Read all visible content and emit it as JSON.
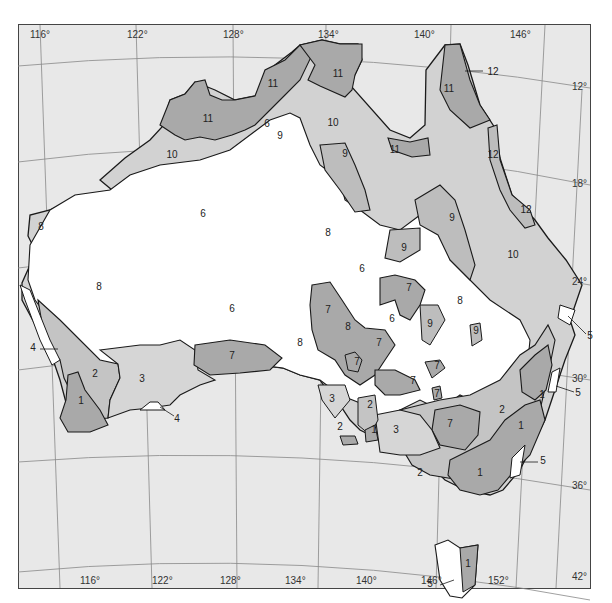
{
  "map": {
    "title": "",
    "colors": {
      "ocean": "#e8e8e8",
      "grid": "#888888",
      "outline": "#1a1a1a",
      "zone_light": "#d2d2d2",
      "zone_dark": "#a9a9a9",
      "zone_white": "#ffffff"
    },
    "longitude_labels_top": [
      "116°",
      "122°",
      "128°",
      "134°",
      "140°",
      "146°"
    ],
    "longitude_labels_bottom": [
      "116°",
      "122°",
      "128°",
      "134°",
      "140°",
      "146°",
      "152°"
    ],
    "latitude_labels": [
      "12°",
      "18°",
      "24°",
      "30°",
      "36°",
      "42°"
    ],
    "zone_labels": [
      {
        "id": "z11a",
        "text": "11",
        "x": 208,
        "y": 122
      },
      {
        "id": "z11b",
        "text": "11",
        "x": 273,
        "y": 87
      },
      {
        "id": "z11c",
        "text": "11",
        "x": 338,
        "y": 77
      },
      {
        "id": "z11d",
        "text": "11",
        "x": 449,
        "y": 92
      },
      {
        "id": "z11e",
        "text": "11",
        "x": 395,
        "y": 153
      },
      {
        "id": "z12a",
        "text": "12",
        "x": 493,
        "y": 75
      },
      {
        "id": "z12b",
        "text": "12",
        "x": 493,
        "y": 158
      },
      {
        "id": "z12c",
        "text": "12",
        "x": 526,
        "y": 213
      },
      {
        "id": "z6a",
        "text": "6",
        "x": 267,
        "y": 127
      },
      {
        "id": "z9a",
        "text": "9",
        "x": 280,
        "y": 139
      },
      {
        "id": "z10a",
        "text": "10",
        "x": 172,
        "y": 158
      },
      {
        "id": "z10b",
        "text": "10",
        "x": 333,
        "y": 126
      },
      {
        "id": "z9b",
        "text": "9",
        "x": 345,
        "y": 157
      },
      {
        "id": "z8a",
        "text": "8",
        "x": 41,
        "y": 230
      },
      {
        "id": "z6b",
        "text": "6",
        "x": 203,
        "y": 217
      },
      {
        "id": "z8b",
        "text": "8",
        "x": 328,
        "y": 236
      },
      {
        "id": "z9c",
        "text": "9",
        "x": 452,
        "y": 221
      },
      {
        "id": "z9d",
        "text": "9",
        "x": 404,
        "y": 251
      },
      {
        "id": "z10c",
        "text": "10",
        "x": 513,
        "y": 258
      },
      {
        "id": "z6c",
        "text": "6",
        "x": 362,
        "y": 272
      },
      {
        "id": "z8c",
        "text": "8",
        "x": 99,
        "y": 290
      },
      {
        "id": "z7a",
        "text": "7",
        "x": 409,
        "y": 291
      },
      {
        "id": "z8d",
        "text": "8",
        "x": 460,
        "y": 304
      },
      {
        "id": "z7b",
        "text": "7",
        "x": 328,
        "y": 313
      },
      {
        "id": "z8e",
        "text": "8",
        "x": 348,
        "y": 330
      },
      {
        "id": "z6d",
        "text": "6",
        "x": 392,
        "y": 322
      },
      {
        "id": "z9e",
        "text": "9",
        "x": 430,
        "y": 327
      },
      {
        "id": "z9f",
        "text": "9",
        "x": 476,
        "y": 334
      },
      {
        "id": "z6e",
        "text": "6",
        "x": 232,
        "y": 312
      },
      {
        "id": "z8f",
        "text": "8",
        "x": 300,
        "y": 346
      },
      {
        "id": "z7c",
        "text": "7",
        "x": 379,
        "y": 346
      },
      {
        "id": "z7d",
        "text": "7",
        "x": 357,
        "y": 365
      },
      {
        "id": "z7e",
        "text": "7",
        "x": 437,
        "y": 369
      },
      {
        "id": "z7f",
        "text": "7",
        "x": 232,
        "y": 359
      },
      {
        "id": "z7g",
        "text": "7",
        "x": 413,
        "y": 384
      },
      {
        "id": "z7h",
        "text": "7",
        "x": 437,
        "y": 397
      },
      {
        "id": "z4a",
        "text": "4",
        "x": 33,
        "y": 351
      },
      {
        "id": "z2a",
        "text": "2",
        "x": 95,
        "y": 377
      },
      {
        "id": "z3a",
        "text": "3",
        "x": 142,
        "y": 382
      },
      {
        "id": "z1a",
        "text": "1",
        "x": 81,
        "y": 404
      },
      {
        "id": "z4b",
        "text": "4",
        "x": 177,
        "y": 422
      },
      {
        "id": "z3b",
        "text": "3",
        "x": 332,
        "y": 402
      },
      {
        "id": "z2b",
        "text": "2",
        "x": 370,
        "y": 408
      },
      {
        "id": "z2c",
        "text": "2",
        "x": 340,
        "y": 430
      },
      {
        "id": "z1b",
        "text": "1",
        "x": 374,
        "y": 433
      },
      {
        "id": "z3c",
        "text": "3",
        "x": 396,
        "y": 433
      },
      {
        "id": "z7i",
        "text": "7",
        "x": 450,
        "y": 427
      },
      {
        "id": "z2d",
        "text": "2",
        "x": 502,
        "y": 413
      },
      {
        "id": "z1c",
        "text": "1",
        "x": 542,
        "y": 398
      },
      {
        "id": "z1d",
        "text": "1",
        "x": 521,
        "y": 429
      },
      {
        "id": "z5a",
        "text": "5",
        "x": 590,
        "y": 339
      },
      {
        "id": "z5b",
        "text": "5",
        "x": 578,
        "y": 396
      },
      {
        "id": "z5c",
        "text": "5",
        "x": 543,
        "y": 464
      },
      {
        "id": "z2e",
        "text": "2",
        "x": 420,
        "y": 476
      },
      {
        "id": "z1e",
        "text": "1",
        "x": 480,
        "y": 476
      },
      {
        "id": "z1f",
        "text": "1",
        "x": 468,
        "y": 567
      },
      {
        "id": "z5d",
        "text": "5",
        "x": 430,
        "y": 587
      }
    ]
  }
}
